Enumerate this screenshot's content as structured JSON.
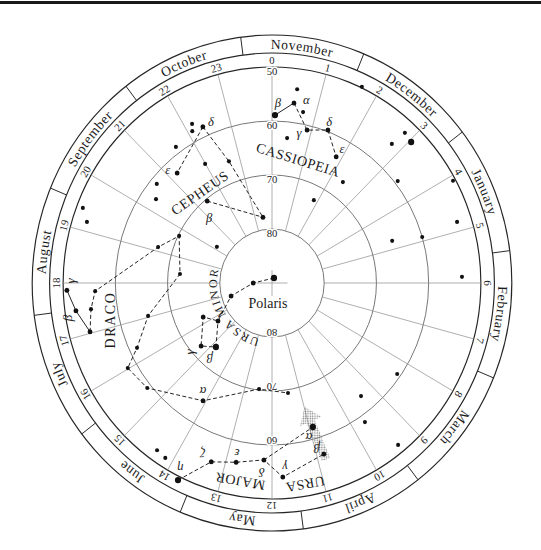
{
  "chart": {
    "center_label": "Polaris",
    "months": [
      {
        "name": "November",
        "ra": 0.5
      },
      {
        "name": "December",
        "ra": 2.5
      },
      {
        "name": "January",
        "ra": 4.5
      },
      {
        "name": "February",
        "ra": 6.5
      },
      {
        "name": "March",
        "ra": 8.5
      },
      {
        "name": "April",
        "ra": 10.5
      },
      {
        "name": "May",
        "ra": 12.5
      },
      {
        "name": "June",
        "ra": 14.5
      },
      {
        "name": "July",
        "ra": 16.5
      },
      {
        "name": "August",
        "ra": 18.5
      },
      {
        "name": "September",
        "ra": 20.5
      },
      {
        "name": "October",
        "ra": 22.5
      }
    ],
    "month_boundaries_ra": [
      1.5,
      3.5,
      5.5,
      7.5,
      9.5,
      11.5,
      13.5,
      15.5,
      17.5,
      19.5,
      21.5,
      23.5
    ],
    "hour_labels": [
      "0",
      "1",
      "2",
      "3",
      "4",
      "5",
      "6",
      "7",
      "8",
      "9",
      "10",
      "11",
      "12",
      "13",
      "14",
      "15",
      "16",
      "17",
      "18",
      "19",
      "20",
      "21",
      "22",
      "23"
    ],
    "dec_circles": [
      80,
      70,
      60,
      50
    ],
    "dec_labels": [
      {
        "text": "50",
        "dec": 50,
        "ra": 0
      },
      {
        "text": "60",
        "dec": 60,
        "ra": 0
      },
      {
        "text": "70",
        "dec": 70,
        "ra": 0
      },
      {
        "text": "80",
        "dec": 80,
        "ra": 0
      },
      {
        "text": "80",
        "dec": 80,
        "ra": 12
      },
      {
        "text": "70",
        "dec": 70,
        "ra": 12
      },
      {
        "text": "60",
        "dec": 60,
        "ra": 12
      }
    ],
    "constellations": [
      {
        "key": "cassiopeia",
        "name": "CASSIOPEIA",
        "stars": [
          {
            "id": "cas-beta",
            "ra": 0.07,
            "dec": 58.9,
            "mag": "bright",
            "label": "β",
            "label_at": [
              0.13,
              56.7
            ]
          },
          {
            "id": "cas-alpha",
            "ra": 0.48,
            "dec": 56.4,
            "mag": "medium",
            "label": "α",
            "label_at": [
              0.73,
              55.5
            ]
          },
          {
            "id": "cas-gamma",
            "ra": 0.89,
            "dec": 60.9,
            "mag": "medium",
            "label": "γ",
            "label_at": [
              0.7,
              61.7
            ]
          },
          {
            "id": "cas-delta",
            "ra": 1.38,
            "dec": 59.7,
            "mag": "medium",
            "label": "δ",
            "label_at": [
              1.34,
              58.2
            ]
          },
          {
            "id": "cas-epsilon",
            "ra": 1.85,
            "dec": 63.6,
            "mag": "medium",
            "label": "ε",
            "label_at": [
              1.89,
              61.8
            ]
          },
          {
            "id": "cas-1",
            "ra": 0.51,
            "dec": 53.8,
            "mag": "faint"
          },
          {
            "id": "cas-2",
            "ra": 0.71,
            "dec": 57.8,
            "mag": "faint"
          },
          {
            "id": "cas-3",
            "ra": 0.41,
            "dec": 63.0,
            "mag": "faint"
          }
        ],
        "lines": [
          {
            "style": "solid",
            "stars": [
              "cas-beta",
              "cas-alpha"
            ]
          },
          {
            "style": "dashed",
            "stars": [
              "cas-alpha",
              "cas-gamma",
              "cas-delta",
              "cas-epsilon"
            ]
          }
        ]
      },
      {
        "key": "cepheus",
        "name": "CEPHEUS",
        "stars": [
          {
            "id": "cep-delta",
            "ra": 22.36,
            "dec": 58.2,
            "mag": "medium",
            "label": "δ",
            "label_at": [
              22.57,
              58.0
            ]
          },
          {
            "id": "cep-epsilon",
            "ra": 21.22,
            "dec": 62.7,
            "mag": "medium",
            "label": "ε",
            "label_at": [
              21.09,
              61.1
            ]
          },
          {
            "id": "cep-beta",
            "ra": 21.38,
            "dec": 70.4,
            "mag": "medium",
            "label": "β",
            "label_at": [
              21.0,
              73.0
            ]
          },
          {
            "id": "cep-1",
            "ra": 22.66,
            "dec": 66.0,
            "mag": "faint"
          },
          {
            "id": "cep-2",
            "ra": 23.46,
            "dec": 77.7,
            "mag": "medium"
          },
          {
            "id": "cep-3",
            "ra": 22.17,
            "dec": 56.8,
            "mag": "faint"
          },
          {
            "id": "cep-4",
            "ra": 22.1,
            "dec": 58.0,
            "mag": "faint"
          },
          {
            "id": "cep-5",
            "ra": 21.59,
            "dec": 58.8,
            "mag": "faint"
          },
          {
            "id": "cep-6",
            "ra": 21.99,
            "dec": 64.5,
            "mag": "faint"
          },
          {
            "id": "cep-7",
            "ra": 20.65,
            "dec": 61.3,
            "mag": "faint"
          },
          {
            "id": "cep-8",
            "ra": 20.33,
            "dec": 62.9,
            "mag": "faint"
          }
        ],
        "lines": [
          {
            "style": "dashed",
            "stars": [
              "cep-delta",
              "cep-epsilon"
            ]
          },
          {
            "style": "dashed",
            "stars": [
              "cep-delta",
              "cep-1",
              "cep-2"
            ]
          },
          {
            "style": "dashed",
            "stars": [
              "cep-beta",
              "cep-2"
            ]
          }
        ]
      },
      {
        "key": "draco",
        "name": "DRACO",
        "stars": [
          {
            "id": "dra-gamma",
            "ra": 17.87,
            "dec": 50.7,
            "mag": "medium",
            "label": "γ",
            "label_at": [
              18.04,
              51.6
            ]
          },
          {
            "id": "dra-beta",
            "ra": 17.48,
            "dec": 52.1,
            "mag": "medium",
            "label": "β",
            "label_at": [
              17.37,
              50.4
            ]
          },
          {
            "id": "dra-1",
            "ra": 17.03,
            "dec": 54.0,
            "mag": "medium"
          },
          {
            "id": "dra-2",
            "ra": 17.47,
            "dec": 55.0,
            "mag": "faint"
          },
          {
            "id": "dra-3",
            "ra": 17.83,
            "dec": 56.1,
            "mag": "faint"
          },
          {
            "id": "dra-4",
            "ra": 19.13,
            "dec": 67.2,
            "mag": "faint"
          },
          {
            "id": "dra-5",
            "ra": 19.74,
            "dec": 70.2,
            "mag": "faint"
          },
          {
            "id": "dra-6",
            "ra": 18.36,
            "dec": 72.3,
            "mag": "faint"
          },
          {
            "id": "dra-7",
            "ra": 17.04,
            "dec": 65.5,
            "mag": "faint"
          },
          {
            "id": "dra-8",
            "ra": 16.34,
            "dec": 61.5,
            "mag": "faint"
          },
          {
            "id": "dra-9",
            "ra": 16.02,
            "dec": 58.2,
            "mag": "faint"
          },
          {
            "id": "dra-10",
            "ra": 15.39,
            "dec": 59.2,
            "mag": "faint"
          },
          {
            "id": "dra-alpha",
            "ra": 14.08,
            "dec": 64.5,
            "mag": "medium",
            "label": "α",
            "label_at": [
              14.23,
              66.0
            ]
          },
          {
            "id": "dra-11",
            "ra": 12.48,
            "dec": 70.2,
            "mag": "faint"
          },
          {
            "id": "dra-12",
            "ra": 11.43,
            "dec": 69.4,
            "mag": "faint"
          }
        ],
        "lines": [
          {
            "style": "solid",
            "stars": [
              "dra-gamma",
              "dra-beta",
              "dra-1"
            ]
          },
          {
            "style": "dashed",
            "stars": [
              "dra-1",
              "dra-2",
              "dra-3",
              "dra-4",
              "dra-5",
              "dra-6",
              "dra-7",
              "dra-8",
              "dra-9",
              "dra-10",
              "dra-alpha",
              "dra-11",
              "dra-12"
            ]
          }
        ]
      },
      {
        "key": "ursa_minor",
        "name": "URSA MINOR",
        "stars": [
          {
            "id": "umi-polaris",
            "ra": 1.5,
            "dec": 89.0,
            "mag": "bright"
          },
          {
            "id": "umi-1",
            "ra": 18.0,
            "dec": 86.4,
            "mag": "medium"
          },
          {
            "id": "umi-2",
            "ra": 16.86,
            "dec": 81.8,
            "mag": "medium"
          },
          {
            "id": "umi-3",
            "ra": 15.72,
            "dec": 77.5,
            "mag": "medium"
          },
          {
            "id": "umi-4",
            "ra": 16.3,
            "dec": 75.4,
            "mag": "medium"
          },
          {
            "id": "umi-gamma",
            "ra": 15.29,
            "dec": 72.1,
            "mag": "medium",
            "label": "γ",
            "label_at": [
              15.39,
              69.8
            ]
          },
          {
            "id": "umi-beta",
            "ra": 14.81,
            "dec": 74.0,
            "mag": "bright",
            "label": "β",
            "label_at": [
              14.7,
              71.7
            ]
          }
        ],
        "lines": [
          {
            "style": "dashed",
            "stars": [
              "umi-polaris",
              "umi-1",
              "umi-2",
              "umi-3",
              "umi-4",
              "umi-gamma",
              "umi-beta",
              "umi-3"
            ]
          }
        ]
      },
      {
        "key": "ursa_major",
        "name": "URSA MAJOR",
        "name_words": [
          "URSA",
          "MAJOR"
        ],
        "stars": [
          {
            "id": "uma-alpha",
            "ra": 10.91,
            "dec": 62.2,
            "mag": "bright",
            "label": "α",
            "label_at": [
              11.07,
              60.6
            ]
          },
          {
            "id": "uma-beta",
            "ra": 10.84,
            "dec": 56.8,
            "mag": "medium",
            "label": "β",
            "label_at": [
              10.95,
              58.3
            ]
          },
          {
            "id": "uma-gamma",
            "ra": 11.78,
            "dec": 54.0,
            "mag": "medium",
            "label": "γ",
            "label_at": [
              11.72,
              55.8
            ]
          },
          {
            "id": "uma-delta",
            "ra": 12.18,
            "dec": 57.2,
            "mag": "medium",
            "label": "δ",
            "label_at": [
              12.21,
              54.95
            ]
          },
          {
            "id": "uma-epsilon",
            "ra": 12.78,
            "dec": 56.1,
            "mag": "medium",
            "label": "ε",
            "label_at": [
              12.8,
              57.8
            ]
          },
          {
            "id": "uma-zeta",
            "ra": 13.29,
            "dec": 54.9,
            "mag": "medium",
            "label": "ζ",
            "label_at": [
              13.52,
              55.9
            ]
          },
          {
            "id": "uma-eta",
            "ra": 13.75,
            "dec": 49.3,
            "mag": "bright",
            "label": "η",
            "label_at": [
              13.81,
              51.5
            ]
          }
        ],
        "lines": [
          {
            "style": "dashed",
            "stars": [
              "uma-eta",
              "uma-zeta",
              "uma-epsilon",
              "uma-delta",
              "uma-gamma",
              "uma-beta"
            ]
          },
          {
            "style": "dashed",
            "stars": [
              "uma-delta",
              "uma-alpha"
            ]
          }
        ]
      }
    ],
    "field_stars": [
      {
        "id": "fs-1",
        "ra": 1.69,
        "dec": 49.8,
        "mag": "faint"
      },
      {
        "id": "fs-2",
        "ra": 2.4,
        "dec": 66.9,
        "mag": "faint"
      },
      {
        "id": "fs-3",
        "ra": 1.84,
        "dec": 72.7,
        "mag": "faint"
      },
      {
        "id": "fs-4",
        "ra": 20.16,
        "dec": 77.5,
        "mag": "faint"
      },
      {
        "id": "fs-5",
        "ra": 19.4,
        "dec": 51.2,
        "mag": "faint"
      },
      {
        "id": "fs-6",
        "ra": 19.18,
        "dec": 52.8,
        "mag": "faint"
      },
      {
        "id": "fs-7",
        "ra": 14.36,
        "dec": 52.0,
        "mag": "faint"
      },
      {
        "id": "fs-8",
        "ra": 14.15,
        "dec": 51.7,
        "mag": "faint"
      },
      {
        "id": "fs-9",
        "ra": 9.39,
        "dec": 63.0,
        "mag": "faint"
      },
      {
        "id": "fs-10",
        "ra": 9.69,
        "dec": 58.7,
        "mag": "faint"
      },
      {
        "id": "fs-11",
        "ra": 9.41,
        "dec": 51.5,
        "mag": "faint"
      },
      {
        "id": "fs-12",
        "ra": 8.34,
        "dec": 60.7,
        "mag": "faint"
      },
      {
        "id": "fs-13",
        "ra": 5.88,
        "dec": 53.6,
        "mag": "faint"
      },
      {
        "id": "fs-14",
        "ra": 2.83,
        "dec": 52.3,
        "mag": "faint"
      },
      {
        "id": "fs-15",
        "ra": 2.78,
        "dec": 55.5,
        "mag": "faint"
      },
      {
        "id": "fs-16",
        "ra": 3.04,
        "dec": 52.7,
        "mag": "bright"
      },
      {
        "id": "fs-17",
        "ra": 3.46,
        "dec": 59.4,
        "mag": "faint"
      },
      {
        "id": "fs-18",
        "ra": 4.09,
        "dec": 50.5,
        "mag": "faint"
      },
      {
        "id": "fs-19",
        "ra": 4.82,
        "dec": 52.8,
        "mag": "faint"
      },
      {
        "id": "fs-20",
        "ra": 4.9,
        "dec": 60.0,
        "mag": "faint"
      },
      {
        "id": "fs-21",
        "ra": 4.75,
        "dec": 65.7,
        "mag": "faint"
      }
    ],
    "pointer_arrow": {
      "from": "uma-beta",
      "toward": "uma-alpha",
      "style": "stippled"
    }
  }
}
